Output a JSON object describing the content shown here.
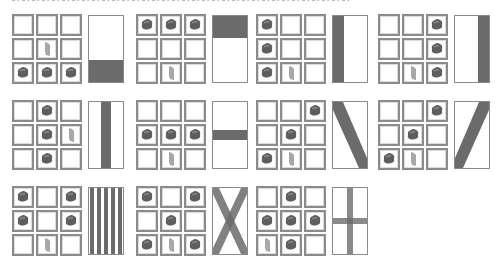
{
  "header": {
    "clipped_text": ""
  },
  "colors": {
    "cell_border": "#8b8b8b",
    "dye": "#5e5e5e",
    "dye_highlight": "#8a8a8a",
    "stick": "#a8a8a8",
    "pattern": "#6b6b6b",
    "banner_bg": "#ffffff"
  },
  "recipes": [
    {
      "name": "base",
      "grid": [
        "___",
        "_s_",
        "ddd"
      ],
      "pattern": "bottom-third"
    },
    {
      "name": "chief",
      "grid": [
        "ddd",
        "___",
        "_s_"
      ],
      "pattern": "top-third"
    },
    {
      "name": "pale-dexter",
      "grid": [
        "d__",
        "d__",
        "ds_"
      ],
      "pattern": "left-third"
    },
    {
      "name": "pale-sinister",
      "grid": [
        "__d",
        "__d",
        "_sd"
      ],
      "pattern": "right-third"
    },
    {
      "name": "pale",
      "grid": [
        "_d_",
        "_ds",
        "_d_"
      ],
      "pattern": "vertical-center"
    },
    {
      "name": "fess",
      "grid": [
        "___",
        "ddd",
        "_s_"
      ],
      "pattern": "horizontal-center"
    },
    {
      "name": "bend",
      "grid": [
        "__d",
        "_d_",
        "ds_"
      ],
      "pattern": "diagonal-down"
    },
    {
      "name": "bend-sinister",
      "grid": [
        "__d",
        "_d_",
        "ds_"
      ],
      "pattern": "diagonal-up"
    },
    {
      "name": "paly",
      "grid": [
        "d_d",
        "d_d",
        "_s_"
      ],
      "pattern": "vertical-stripes"
    },
    {
      "name": "saltire",
      "grid": [
        "d_d",
        "_d_",
        "dsd"
      ],
      "pattern": "cross-diagonal"
    },
    {
      "name": "cross",
      "grid": [
        "_d_",
        "ddd",
        "sd_"
      ],
      "pattern": "cross-straight"
    }
  ]
}
